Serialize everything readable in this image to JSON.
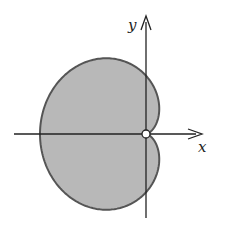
{
  "figure": {
    "type": "polar-region",
    "curve": "cardioid r = 1 - cos(theta)",
    "colors": {
      "fill": "#b8b8b8",
      "stroke": "#555555",
      "axis": "#222222",
      "origin_marker_fill": "#ffffff"
    },
    "axes": {
      "x_label": "x",
      "y_label": "y"
    },
    "origin_marker": "open-circle"
  }
}
